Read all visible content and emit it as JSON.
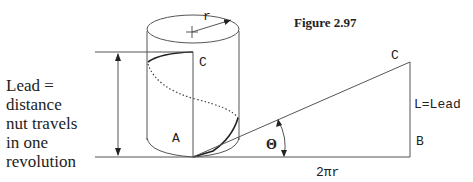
{
  "figure": {
    "title": "Figure 2.97",
    "left_caption": [
      "Lead =",
      "distance",
      "nut travels",
      "in one",
      "revolution"
    ],
    "cylinder_labels": {
      "radius": "r",
      "top_point": "C",
      "bottom_point": "A"
    },
    "triangle_labels": {
      "top_point": "C",
      "right_point": "B",
      "vertical_side": "L=Lead",
      "base": "2πr",
      "angle": "Θ"
    },
    "colors": {
      "line": "#555555",
      "text": "#222222",
      "background": "#ffffff"
    }
  }
}
